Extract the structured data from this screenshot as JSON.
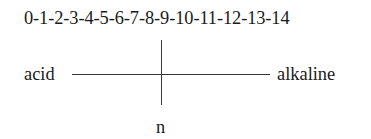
{
  "diagram": {
    "scale_label": "0-1-2-3-4-5-6-7-8-9-10-11-12-13-14",
    "scale_values": [
      0,
      1,
      2,
      3,
      4,
      5,
      6,
      7,
      8,
      9,
      10,
      11,
      12,
      13,
      14
    ],
    "left_label": "acid",
    "right_label": "alkaline",
    "bottom_label": "n",
    "line_color": "#3a3a3a",
    "text_color": "#1a1a1a"
  }
}
